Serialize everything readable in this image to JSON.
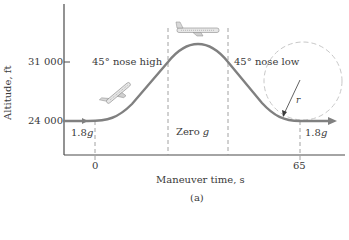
{
  "figure": {
    "caption": "(a)",
    "x_axis_label": "Maneuver time, s",
    "y_axis_label": "Altitude, ft",
    "y_ticks": [
      "31 000",
      "24 000"
    ],
    "x_ticks": [
      "0",
      "65"
    ],
    "phase_labels": {
      "pull_up": "45° nose high",
      "zero_g_prefix": "Zero ",
      "zero_g_g": "g",
      "push_over": "45° nose low"
    },
    "g_labels": {
      "entry_value": "1.8",
      "entry_unit": "g",
      "exit_value": "1.8",
      "exit_unit": "g"
    },
    "radius_label": "r",
    "colors": {
      "curve": "#808080",
      "axes": "#4a4a4a",
      "dashed": "#8a8a8a",
      "circle": "#c8c8c8",
      "text": "#3a3a3a"
    }
  }
}
